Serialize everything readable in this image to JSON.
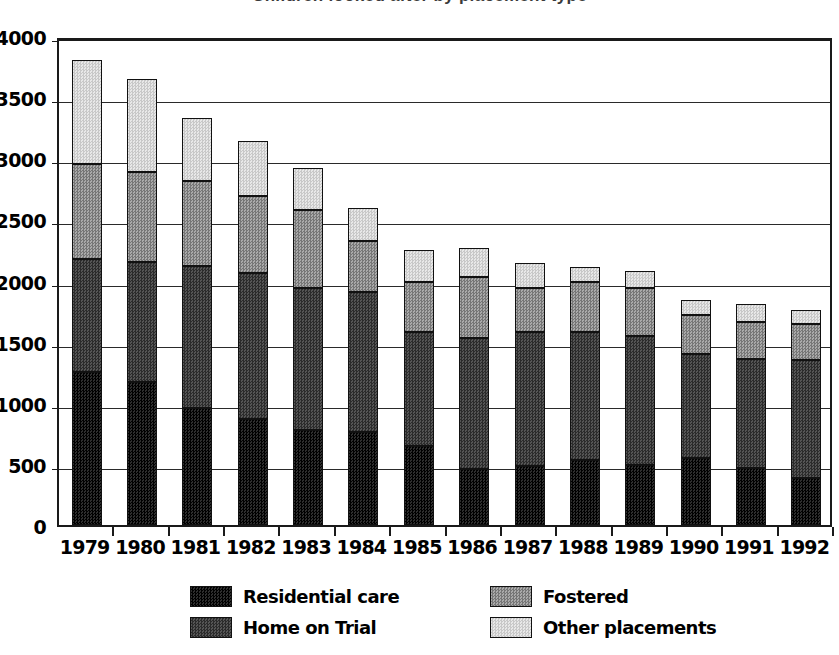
{
  "chart": {
    "title": "Children looked after by placement type",
    "ylabel": "",
    "xlabel": ""
  },
  "legend": {
    "position": "bottom",
    "items": [
      {
        "label": "Residential care",
        "color": "#1b1b1b",
        "key": "residential"
      },
      {
        "label": "Home on Trial",
        "color": "#3d3d3d",
        "key": "home"
      },
      {
        "label": "Fostered",
        "color": "#8f8f8f",
        "key": "fostered"
      },
      {
        "label": "Other placements",
        "color": "#d8d8d8",
        "key": "other"
      }
    ]
  },
  "axis": {
    "y_ticks": [
      0,
      500,
      1000,
      1500,
      2000,
      2500,
      3000,
      3500,
      4000
    ],
    "y_min": 0,
    "y_max": 4000,
    "grid": true
  },
  "chart_data": {
    "type": "bar",
    "stacked": true,
    "title": "Children looked after by placement type",
    "xlabel": "",
    "ylabel": "",
    "ylim": [
      0,
      4000
    ],
    "grid": true,
    "categories": [
      "1979",
      "1980",
      "1981",
      "1982",
      "1983",
      "1984",
      "1985",
      "1986",
      "1987",
      "1988",
      "1989",
      "1990",
      "1991",
      "1992"
    ],
    "series": [
      {
        "name": "Residential care",
        "color": "#1b1b1b",
        "values": [
          1250,
          1170,
          960,
          865,
          780,
          760,
          650,
          460,
          480,
          530,
          490,
          545,
          465,
          385
        ]
      },
      {
        "name": "Home on Trial",
        "color": "#3d3d3d",
        "values": [
          930,
          980,
          1155,
          1200,
          1160,
          1150,
          930,
          1070,
          1100,
          1050,
          1055,
          855,
          890,
          965
        ]
      },
      {
        "name": "Fostered",
        "color": "#8f8f8f",
        "values": [
          770,
          740,
          700,
          630,
          640,
          410,
          405,
          500,
          355,
          410,
          395,
          320,
          305,
          295
        ]
      },
      {
        "name": "Other placements",
        "color": "#d8d8d8",
        "values": [
          850,
          760,
          515,
          445,
          340,
          270,
          265,
          240,
          210,
          120,
          135,
          120,
          145,
          115
        ]
      }
    ],
    "totals": [
      3800,
      3650,
      3330,
      3140,
      2920,
      2590,
      2250,
      2270,
      2145,
      2110,
      2075,
      1840,
      1805,
      1760
    ]
  }
}
